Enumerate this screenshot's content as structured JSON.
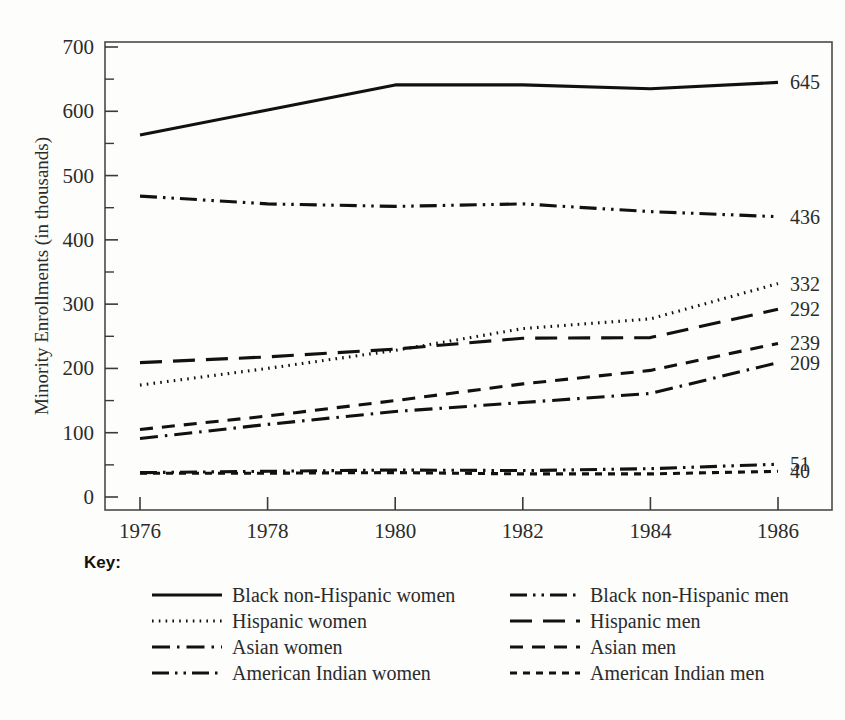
{
  "chart_data": {
    "type": "line",
    "title": "",
    "xlabel": "",
    "ylabel": "Minority Enrollments (in thousands)",
    "xlim": [
      1976,
      1986
    ],
    "ylim": [
      0,
      700
    ],
    "grid": false,
    "legend_position": "below-plot",
    "legend_title": "Key:",
    "x_ticks": [
      "1976",
      "1978",
      "1980",
      "1982",
      "1984",
      "1986"
    ],
    "x": [
      1976,
      1978,
      1980,
      1982,
      1984,
      1986
    ],
    "y_ticks": [
      "0",
      "100",
      "200",
      "300",
      "400",
      "500",
      "600",
      "700"
    ],
    "y_minor_tick_step": 50,
    "series": [
      {
        "name": "Black non-Hispanic women",
        "style": "solid",
        "end_label": "645",
        "values": [
          563,
          602,
          641,
          641,
          635,
          645
        ]
      },
      {
        "name": "Hispanic women",
        "style": "dotted",
        "end_label": "332",
        "values": [
          174,
          200,
          228,
          262,
          277,
          332
        ]
      },
      {
        "name": "Asian women",
        "style": "dash-dot",
        "end_label": "209",
        "values": [
          91,
          113,
          133,
          147,
          161,
          209
        ]
      },
      {
        "name": "American Indian women",
        "style": "dash-dot-dot",
        "end_label": "51",
        "values": [
          38,
          40,
          42,
          41,
          44,
          51
        ]
      },
      {
        "name": "Black non-Hispanic men",
        "style": "dash-dot-dot",
        "end_label": "436",
        "values": [
          468,
          456,
          452,
          456,
          444,
          436
        ]
      },
      {
        "name": "Hispanic men",
        "style": "long-dash",
        "end_label": "292",
        "values": [
          209,
          218,
          230,
          247,
          248,
          292
        ]
      },
      {
        "name": "Asian men",
        "style": "dash",
        "end_label": "239",
        "values": [
          105,
          126,
          150,
          176,
          197,
          239
        ]
      },
      {
        "name": "American Indian men",
        "style": "short-dash",
        "end_label": "40",
        "values": [
          37,
          37,
          38,
          36,
          36,
          40
        ]
      }
    ]
  },
  "axes": {
    "y_title": "Minority Enrollments (in thousands)",
    "y_labels": [
      "700",
      "600",
      "500",
      "400",
      "300",
      "200",
      "100",
      "0"
    ],
    "x_labels": [
      "1976",
      "1978",
      "1980",
      "1982",
      "1984",
      "1986"
    ]
  },
  "end_labels": {
    "black_women": "645",
    "black_men": "436",
    "hispanic_women": "332",
    "hispanic_men": "292",
    "asian_men": "239",
    "asian_women": "209",
    "amind_women": "51",
    "amind_men": "40"
  },
  "key": {
    "title": "Key:",
    "left_column": [
      {
        "label": "Black non-Hispanic women",
        "style": "solid"
      },
      {
        "label": "Hispanic women",
        "style": "dotted"
      },
      {
        "label": "Asian women",
        "style": "dash-dot"
      },
      {
        "label": "American Indian women",
        "style": "dash-dot-dot"
      }
    ],
    "right_column": [
      {
        "label": "Black non-Hispanic men",
        "style": "dash-dot-dot"
      },
      {
        "label": "Hispanic men",
        "style": "long-dash"
      },
      {
        "label": "Asian men",
        "style": "dash"
      },
      {
        "label": "American Indian men",
        "style": "short-dash"
      }
    ]
  },
  "colors": {
    "ink": "#111111",
    "frame": "#4a4a4a",
    "background": "#fdfdfb"
  }
}
